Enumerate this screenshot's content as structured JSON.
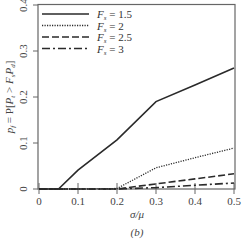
{
  "chart_data": {
    "type": "line",
    "title": "",
    "caption": "(b)",
    "xlabel": "σ/μ",
    "ylabel": "p_f = P[P_t > F_s P_d]",
    "xlim": [
      0,
      0.5
    ],
    "ylim": [
      0,
      0.4
    ],
    "xticks": [
      "0",
      "0.1",
      "0.2",
      "0.3",
      "0.4",
      "0.5"
    ],
    "yticks": [
      "0",
      "0.1",
      "0.2",
      "0.3",
      "0.4"
    ],
    "grid": false,
    "legend_position": "upper left",
    "x": [
      0,
      0.05,
      0.1,
      0.2,
      0.3,
      0.4,
      0.5
    ],
    "series": [
      {
        "name": "F_s = 1.5",
        "style": "solid",
        "values": [
          0,
          0,
          0.041,
          0.107,
          0.19,
          0.226,
          0.263
        ]
      },
      {
        "name": "F_s = 2",
        "style": "dotted",
        "values": [
          0,
          0,
          0,
          0.001,
          0.046,
          0.068,
          0.089
        ]
      },
      {
        "name": "F_s = 2.5",
        "style": "dashed",
        "values": [
          0,
          0,
          0,
          0,
          0.011,
          0.022,
          0.033
        ]
      },
      {
        "name": "F_s = 3",
        "style": "dashdot",
        "values": [
          0,
          0,
          0,
          0,
          0.003,
          0.008,
          0.013
        ]
      }
    ]
  },
  "legend": [
    {
      "prefix": "F",
      "sub": "s",
      "suffix": " = 1.5"
    },
    {
      "prefix": "F",
      "sub": "s",
      "suffix": " = 2"
    },
    {
      "prefix": "F",
      "sub": "s",
      "suffix": " = 2.5"
    },
    {
      "prefix": "F",
      "sub": "s",
      "suffix": " = 3"
    }
  ],
  "colors": {
    "line": "#2a2a2a",
    "axis": "#555555"
  }
}
